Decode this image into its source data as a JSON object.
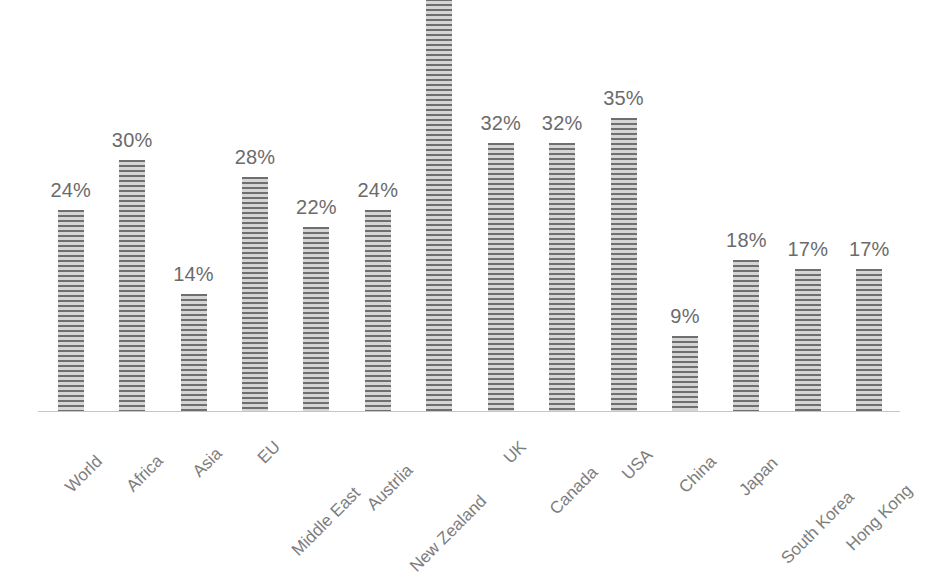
{
  "chart_data": {
    "type": "bar",
    "title": "",
    "subtitle": "",
    "xlabel": "",
    "ylabel": "",
    "ylim": [
      0,
      56
    ],
    "grid": false,
    "legend": null,
    "axis_labels_rotated_deg": -45,
    "categories": [
      "World",
      "Africa",
      "Asia",
      "EU",
      "Middle East",
      "Austrlia",
      "New Zealand",
      "UK",
      "Canada",
      "USA",
      "China",
      "Japan",
      "South Korea",
      "Hong Kong"
    ],
    "values": [
      24,
      30,
      14,
      28,
      22,
      24,
      54,
      32,
      32,
      35,
      9,
      18,
      17,
      17
    ],
    "data_labels": [
      "24%",
      "30%",
      "14%",
      "28%",
      "22%",
      "24%",
      "",
      "32%",
      "32%",
      "35%",
      "9%",
      "18%",
      "17%",
      "17%"
    ],
    "label_visible": [
      true,
      true,
      true,
      true,
      true,
      true,
      false,
      true,
      true,
      true,
      true,
      true,
      true,
      true
    ]
  },
  "style": {
    "bar_stripe_dark": "#6f6f6f",
    "bar_stripe_light": "#d5d5d5",
    "axis_line_color": "#c8c6c4",
    "data_label_color": "#6b6b6b",
    "category_label_color": "#7d7d7d",
    "background": "#ffffff"
  }
}
